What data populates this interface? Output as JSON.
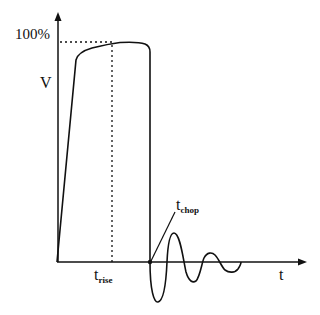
{
  "diagram": {
    "title": "",
    "labels": {
      "y_max": "100%",
      "y_axis": "V",
      "x_axis": "t",
      "t_rise_main": "t",
      "t_rise_sub": "rise",
      "t_chop_main": "t",
      "t_chop_sub": "chop"
    },
    "colors": {
      "stroke": "#111111",
      "background": "#ffffff"
    },
    "elements": [
      {
        "id": "y-axis",
        "type": "arrow",
        "from": [
          58,
          262
        ],
        "to": [
          58,
          13
        ]
      },
      {
        "id": "x-axis",
        "type": "arrow",
        "from": [
          58,
          262
        ],
        "to": [
          306,
          262
        ]
      },
      {
        "id": "hundred-percent-guide",
        "type": "dotted-line",
        "from": [
          58,
          42
        ],
        "to": [
          112,
          42
        ]
      },
      {
        "id": "t-rise-guide",
        "type": "dotted-line",
        "from": [
          112,
          42
        ],
        "to": [
          112,
          262
        ]
      },
      {
        "id": "impulse-waveform",
        "type": "curve",
        "description": "steep linear rise to ~90%, rounded crest reaching 100% near t_rise, vertical chop to zero"
      },
      {
        "id": "chop-oscillation",
        "type": "curve",
        "description": "damped oscillation after chop around zero"
      },
      {
        "id": "t-chop-leader",
        "type": "line",
        "from": [
          174,
          212
        ],
        "to": [
          150,
          262
        ]
      },
      {
        "id": "t-chop-point",
        "type": "dot",
        "at": [
          150,
          262
        ]
      }
    ]
  }
}
